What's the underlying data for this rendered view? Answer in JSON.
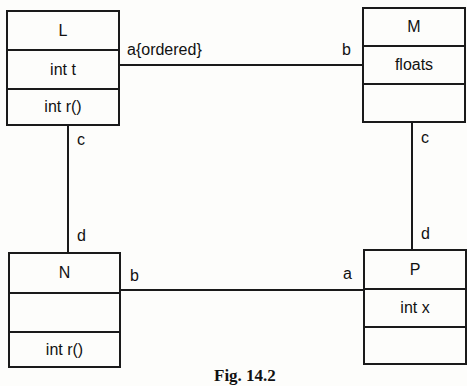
{
  "figure": {
    "caption": "Fig. 14.2",
    "classes": {
      "L": {
        "name": "L",
        "attributes": "int t",
        "operations": "int r()"
      },
      "M": {
        "name": "M",
        "attributes": "floats",
        "operations": ""
      },
      "N": {
        "name": "N",
        "attributes": "",
        "operations": "int r()"
      },
      "P": {
        "name": "P",
        "attributes": "int x",
        "operations": ""
      }
    },
    "associations": [
      {
        "from": "L",
        "to": "M",
        "from_role": "a{ordered}",
        "to_role": "b"
      },
      {
        "from": "L",
        "to": "N",
        "from_role": "c",
        "to_role": "d"
      },
      {
        "from": "M",
        "to": "P",
        "from_role": "c",
        "to_role": "d"
      },
      {
        "from": "N",
        "to": "P",
        "from_role": "b",
        "to_role": "a"
      }
    ]
  }
}
